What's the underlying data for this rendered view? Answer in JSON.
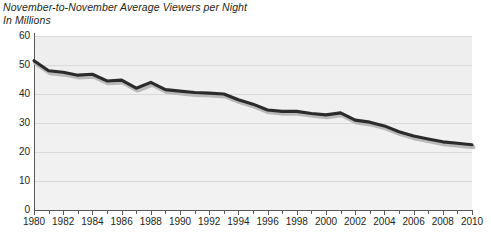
{
  "chart_data": {
    "type": "line",
    "title": "November-to-November Average Viewers per Night",
    "subtitle": "In Millions",
    "xlabel": "",
    "ylabel": "",
    "ylim": [
      0,
      60
    ],
    "xlim": [
      1980,
      2010
    ],
    "y_ticks": [
      0,
      10,
      20,
      30,
      40,
      50,
      60
    ],
    "x_ticks": [
      1980,
      1981,
      1982,
      1983,
      1984,
      1985,
      1986,
      1987,
      1988,
      1989,
      1990,
      1991,
      1992,
      1993,
      1994,
      1995,
      1996,
      1997,
      1998,
      1999,
      2000,
      2001,
      2002,
      2003,
      2004,
      2005,
      2006,
      2007,
      2008,
      2009,
      2010
    ],
    "x_tick_labels": [
      "1980",
      "1982",
      "1984",
      "1986",
      "1988",
      "1990",
      "1992",
      "1994",
      "1996",
      "1998",
      "2000",
      "2002",
      "2004",
      "2006",
      "2008",
      "2010"
    ],
    "grid": true,
    "legend": "none",
    "series_name": "Average Viewers per Night",
    "line_color": "#2b2b2b",
    "plot_background": "#f0f0f0",
    "gridline_color": "#d9d9d9",
    "axis_color": "#58595b",
    "text_color": "#231f20",
    "x": [
      1980,
      1981,
      1982,
      1983,
      1984,
      1985,
      1986,
      1987,
      1988,
      1989,
      1990,
      1991,
      1992,
      1993,
      1994,
      1995,
      1996,
      1997,
      1998,
      1999,
      2000,
      2001,
      2002,
      2003,
      2004,
      2005,
      2006,
      2007,
      2008,
      2009,
      2010
    ],
    "values": [
      51.5,
      48.0,
      47.5,
      46.5,
      46.8,
      44.5,
      44.8,
      42.0,
      44.0,
      41.5,
      41.0,
      40.5,
      40.3,
      40.0,
      38.0,
      36.5,
      34.5,
      34.0,
      34.0,
      33.3,
      32.8,
      33.5,
      31.0,
      30.3,
      29.0,
      27.0,
      25.5,
      24.5,
      23.5,
      23.0,
      22.5
    ]
  }
}
